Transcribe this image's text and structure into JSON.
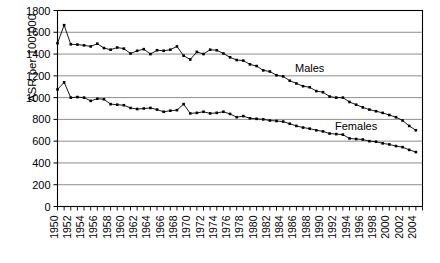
{
  "chart_data": {
    "type": "line",
    "title": "",
    "xlabel": "",
    "ylabel": "ASR per 100,000",
    "ylim": [
      0,
      1800
    ],
    "ytick_step": 200,
    "yticks": [
      0,
      200,
      400,
      600,
      800,
      1000,
      1200,
      1400,
      1600,
      1800
    ],
    "xlim": [
      1950,
      2005
    ],
    "xtick_labels": [
      "1950",
      "1952",
      "1954",
      "1956",
      "1958",
      "1960",
      "1962",
      "1964",
      "1966",
      "1968",
      "1970",
      "1972",
      "1974",
      "1976",
      "1978",
      "1980",
      "1982",
      "1984",
      "1986",
      "1988",
      "1990",
      "1992",
      "1994",
      "1996",
      "1998",
      "2000",
      "2002",
      "2004"
    ],
    "xtick_step": 2,
    "minor_xtick_step": 1,
    "grid": "horizontal",
    "legend_position": "inline-annotation",
    "marker": "square",
    "line_color": "#000000",
    "grid_color": "#808080",
    "axis_color": "#000000",
    "background": "#ffffff",
    "x": [
      1950,
      1951,
      1952,
      1953,
      1954,
      1955,
      1956,
      1957,
      1958,
      1959,
      1960,
      1961,
      1962,
      1963,
      1964,
      1965,
      1966,
      1967,
      1968,
      1969,
      1970,
      1971,
      1972,
      1973,
      1974,
      1975,
      1976,
      1977,
      1978,
      1979,
      1980,
      1981,
      1982,
      1983,
      1984,
      1985,
      1986,
      1987,
      1988,
      1989,
      1990,
      1991,
      1992,
      1993,
      1994,
      1995,
      1996,
      1997,
      1998,
      1999,
      2000,
      2001,
      2002,
      2003,
      2004
    ],
    "series": [
      {
        "name": "Males",
        "label": "Males",
        "values": [
          1500,
          1665,
          1490,
          1487,
          1480,
          1470,
          1495,
          1455,
          1440,
          1460,
          1450,
          1405,
          1430,
          1445,
          1400,
          1435,
          1430,
          1440,
          1470,
          1385,
          1350,
          1420,
          1400,
          1440,
          1435,
          1405,
          1370,
          1345,
          1340,
          1305,
          1290,
          1250,
          1240,
          1205,
          1195,
          1155,
          1130,
          1105,
          1095,
          1060,
          1050,
          1010,
          1000,
          1000,
          960,
          935,
          910,
          890,
          875,
          860,
          840,
          820,
          790,
          740,
          700
        ]
      },
      {
        "name": "Females",
        "label": "Females",
        "values": [
          1075,
          1140,
          1000,
          1005,
          1000,
          970,
          990,
          985,
          940,
          935,
          930,
          905,
          895,
          900,
          905,
          890,
          870,
          880,
          885,
          940,
          855,
          860,
          870,
          855,
          860,
          870,
          850,
          820,
          830,
          810,
          805,
          800,
          790,
          785,
          780,
          760,
          740,
          725,
          715,
          700,
          690,
          670,
          665,
          660,
          625,
          620,
          615,
          600,
          595,
          580,
          570,
          555,
          545,
          520,
          500
        ]
      }
    ],
    "annotations": [
      {
        "text": "Males",
        "x": 1988,
        "y": 1235
      },
      {
        "text": "Females",
        "x": 1995,
        "y": 700
      }
    ]
  }
}
